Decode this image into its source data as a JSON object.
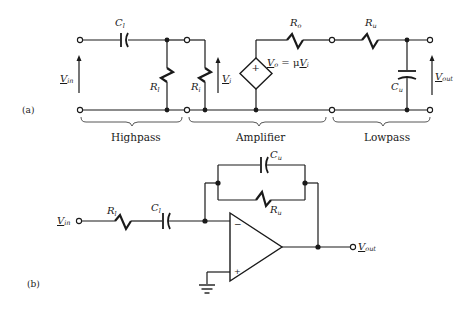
{
  "figure_a": {
    "tag": "(a)",
    "sections": [
      {
        "label": "Highpass"
      },
      {
        "label": "Amplifier"
      },
      {
        "label": "Lowpass"
      }
    ],
    "components": {
      "c_l": {
        "main": "C",
        "sub": "l"
      },
      "r_l_left": {
        "main": "R",
        "sub": "l"
      },
      "r_i": {
        "main": "R",
        "sub": "i"
      },
      "r_o": {
        "main": "R",
        "sub": "o"
      },
      "r_u": {
        "main": "R",
        "sub": "u"
      },
      "c_u": {
        "main": "C",
        "sub": "u"
      },
      "source_eq": {
        "lhs": "V",
        "lhs_sub": "o",
        "eq": " = μ",
        "rhs": "V",
        "rhs_sub": "i"
      },
      "source_sign": "+"
    },
    "voltages": {
      "v_in": {
        "main": "V",
        "sub": "in"
      },
      "v_i": {
        "main": "V",
        "sub": "i"
      },
      "v_out": {
        "main": "V",
        "sub": "out"
      }
    }
  },
  "figure_b": {
    "tag": "(b)",
    "components": {
      "r_l": {
        "main": "R",
        "sub": "l"
      },
      "c_l": {
        "main": "C",
        "sub": "l"
      },
      "c_u": {
        "main": "C",
        "sub": "u"
      },
      "r_u": {
        "main": "R",
        "sub": "u"
      }
    },
    "opamp": {
      "minus": "−",
      "plus": "+"
    },
    "voltages": {
      "v_in": {
        "main": "V",
        "sub": "in"
      },
      "v_out": {
        "main": "V",
        "sub": "out"
      }
    }
  }
}
